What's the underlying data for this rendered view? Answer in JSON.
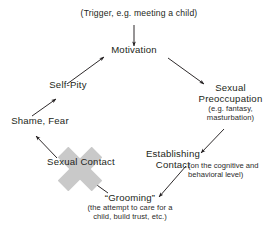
{
  "diagram": {
    "type": "cycle-flow-diagram",
    "background_color": "#ffffff",
    "text_color": "#231f20",
    "arrow_color": "#231f20",
    "watermark_color": "#c9c9c9",
    "width": 278,
    "height": 239
  },
  "nodes": {
    "trigger": {
      "label": "(Trigger, e.g. meeting a child)"
    },
    "motivation": {
      "label": "Motivation"
    },
    "preoccupation": {
      "line1": "Sexual",
      "line2": "Preoccupation",
      "sub1": "(e.g. fantasy,",
      "sub2": "masturbation)"
    },
    "establishing": {
      "line1": "Establishing",
      "line2": "Contact"
    },
    "establishing_note": {
      "line1": "(on the cognitive and",
      "line2": "behavioral level)"
    },
    "grooming": {
      "label": "“Grooming”",
      "sub1": "(the attempt to care for a",
      "sub2": "child, build trust, etc.)"
    },
    "sexual_contact": {
      "label": "Sexual Contact"
    },
    "shame_fear": {
      "label": "Shame, Fear"
    },
    "self_pity": {
      "label": "Self-Pity"
    }
  },
  "edges": [
    {
      "name": "trigger-to-motivation",
      "from": "trigger",
      "to": "motivation"
    },
    {
      "name": "motivation-to-preoccupation",
      "from": "motivation",
      "to": "preoccupation"
    },
    {
      "name": "preoccupation-to-establishing",
      "from": "preoccupation",
      "to": "establishing"
    },
    {
      "name": "establishing-to-grooming",
      "from": "establishing",
      "to": "grooming"
    },
    {
      "name": "grooming-to-sexual-contact",
      "from": "grooming",
      "to": "sexual_contact"
    },
    {
      "name": "sexual-contact-to-shame-fear",
      "from": "sexual_contact",
      "to": "shame_fear"
    },
    {
      "name": "shame-fear-to-self-pity",
      "from": "shame_fear",
      "to": "self_pity"
    },
    {
      "name": "self-pity-to-motivation",
      "from": "self_pity",
      "to": "motivation"
    }
  ]
}
